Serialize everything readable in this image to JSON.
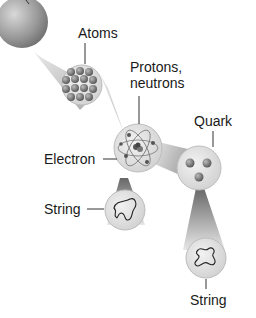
{
  "diagram": {
    "nodes": [
      {
        "id": "matter",
        "label": ""
      },
      {
        "id": "atoms",
        "label": "Atoms"
      },
      {
        "id": "nucleus",
        "label_line1": "Protons,",
        "label_line2": "neutrons"
      },
      {
        "id": "electron",
        "label": "Electron"
      },
      {
        "id": "quark",
        "label": "Quark"
      },
      {
        "id": "string-electron",
        "label": "String"
      },
      {
        "id": "string-quark",
        "label": "String"
      }
    ]
  }
}
